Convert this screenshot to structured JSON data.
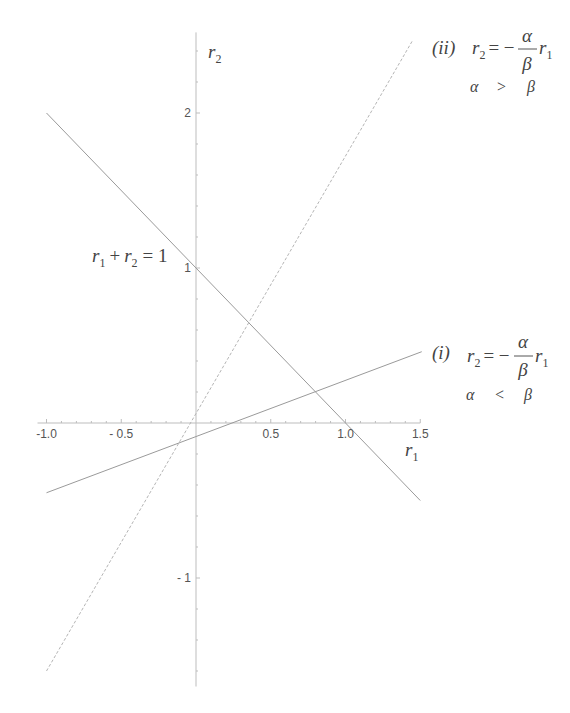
{
  "chart_data": {
    "type": "line",
    "title": "",
    "xlabel": "r1",
    "ylabel": "r2",
    "xlim": [
      -1.05,
      1.5
    ],
    "ylim": [
      -1.7,
      2.5
    ],
    "grid": false,
    "x_ticks": [
      -1.0,
      -0.5,
      0.5,
      1.0,
      1.5
    ],
    "x_tick_labels": [
      "-1.0",
      "- 0.5",
      "0.5",
      "1.0",
      "1.5"
    ],
    "y_ticks": [
      2,
      1,
      -1
    ],
    "y_tick_labels": [
      "2",
      "1",
      "- 1"
    ],
    "series": [
      {
        "name": "r1 + r2 = 1",
        "style": "solid",
        "x": [
          -1.0,
          1.5
        ],
        "y": [
          2.0,
          -0.5
        ]
      },
      {
        "name": "(ii) r2 = -α/β r1, α > β",
        "style": "dashed",
        "x": [
          -1.0,
          1.45
        ],
        "y": [
          -1.6,
          2.47
        ]
      },
      {
        "name": "(i) r2 = -α/β r1, α < β",
        "style": "solid",
        "x": [
          -1.0,
          1.51
        ],
        "y": [
          -0.45,
          0.46
        ]
      }
    ],
    "annotations": [
      {
        "text": "r1 + r2 = 1",
        "near": [
          -0.45,
          1.05
        ]
      },
      {
        "text": "(ii) r2 = −(α/β) r1",
        "sub": "α > β",
        "near": [
          1.5,
          2.5
        ]
      },
      {
        "text": "(i) r2 = −(α/β) r1",
        "sub": "α < β",
        "near": [
          1.55,
          0.45
        ]
      }
    ]
  },
  "axis": {
    "x_name": "r",
    "x_sub": "1",
    "y_name": "r",
    "y_sub": "2"
  },
  "labels": {
    "sum_line": {
      "a": "r",
      "a_sub": "1",
      "plus": "+",
      "b": "r",
      "b_sub": "2",
      "eq": "= 1"
    },
    "line_ii": {
      "tag": "(ii)",
      "lhs": "r",
      "lhs_sub": "2",
      "eq": "= −",
      "num": "α",
      "den": "β",
      "rhs": "r",
      "rhs_sub": "1",
      "cond_a": "α",
      "cond_op": ">",
      "cond_b": "β"
    },
    "line_i": {
      "tag": "(i)",
      "lhs": "r",
      "lhs_sub": "2",
      "eq": "= −",
      "num": "α",
      "den": "β",
      "rhs": "r",
      "rhs_sub": "1",
      "cond_a": "α",
      "cond_op": "<",
      "cond_b": "β"
    }
  }
}
